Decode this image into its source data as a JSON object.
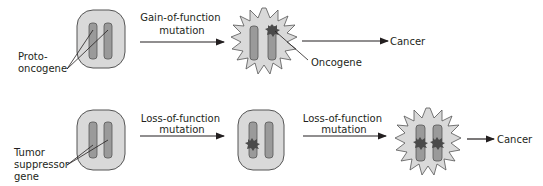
{
  "colors": {
    "cell_fill": "#d9d9d9",
    "cell_stroke": "#555555",
    "chromosome_fill": "#9a9a9a",
    "chromosome_stroke": "#555555",
    "mutation_fill": "#4a4a4a",
    "line": "#231f20"
  },
  "top_row": {
    "label_gene": [
      "Proto-",
      "oncogene"
    ],
    "arrow1_label": [
      "Gain-of-function",
      "mutation"
    ],
    "label_mutant": "Oncogene",
    "outcome": "Cancer"
  },
  "bottom_row": {
    "label_gene": [
      "Tumor",
      "suppressor",
      "gene"
    ],
    "arrow1_label": [
      "Loss-of-function",
      "mutation"
    ],
    "arrow2_label": [
      "Loss-of-function",
      "mutation"
    ],
    "outcome": "Cancer"
  }
}
